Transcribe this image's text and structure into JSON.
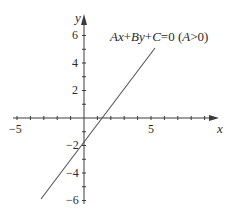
{
  "diagram": {
    "type": "coordinate-plane-line",
    "equation_label": {
      "parts": [
        {
          "text": "A",
          "italic": true
        },
        {
          "text": "x",
          "italic": true
        },
        {
          "text": "+",
          "italic": false
        },
        {
          "text": "B",
          "italic": true
        },
        {
          "text": "y",
          "italic": true
        },
        {
          "text": "+",
          "italic": false
        },
        {
          "text": "C",
          "italic": true
        },
        {
          "text": "=0 (",
          "italic": false
        },
        {
          "text": "A",
          "italic": true
        },
        {
          "text": ">0)",
          "italic": false
        }
      ],
      "full": "Ax+By+C=0 (A>0)"
    },
    "axes": {
      "x_label": "x",
      "y_label": "y",
      "x_range": [
        -5,
        10
      ],
      "y_range": [
        -6,
        7
      ],
      "x_tick_labels": [
        "−5",
        "5"
      ],
      "y_tick_labels": [
        "6",
        "4",
        "2",
        "−2",
        "−4",
        "−6"
      ]
    },
    "line": {
      "x_intercept": 1.2,
      "y_intercept": -1.8,
      "from": [
        -3.2,
        -5.9
      ],
      "to": [
        5.2,
        5.0
      ]
    },
    "colors": {
      "axis": "#3a3a3a",
      "line": "#555555",
      "text": "#2a2a2a"
    }
  }
}
